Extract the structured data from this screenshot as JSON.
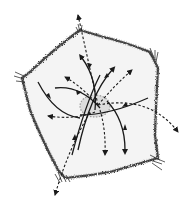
{
  "diagram": {
    "title": "",
    "colors": {
      "background": "#ffffff",
      "cell_fill": "#f4f4f4",
      "outline": "#3a3a3a",
      "arrow": "#1a1a1a",
      "nucleus": "#9a9a9a"
    },
    "outline_points": [
      [
        80,
        30
      ],
      [
        150,
        52
      ],
      [
        158,
        68
      ],
      [
        155,
        135
      ],
      [
        158,
        158
      ],
      [
        110,
        172
      ],
      [
        65,
        178
      ],
      [
        58,
        170
      ],
      [
        30,
        110
      ],
      [
        22,
        78
      ],
      [
        30,
        72
      ]
    ],
    "nucleus": {
      "cx": 95,
      "cy": 106,
      "rx": 15,
      "ry": 11
    },
    "arrows": {
      "solid": [
        {
          "d": "M82,58 Q98,80 95,110",
          "dir": "in"
        },
        {
          "d": "M112,70 Q90,95 78,150",
          "dir": "in",
          "head_at": "start"
        },
        {
          "d": "M38,82 Q55,115 80,118",
          "dir": "in"
        },
        {
          "d": "M55,88 Q80,85 100,108",
          "dir": "in"
        },
        {
          "d": "M148,98 Q110,115 80,115",
          "dir": "in"
        },
        {
          "d": "M107,101 Q125,120 125,150",
          "dir": "in",
          "head_at": "start"
        },
        {
          "d": "M100,75 Q85,105 72,155",
          "dir": "in",
          "head_at": "start"
        }
      ],
      "dashed": [
        {
          "d": "M98,105 L78,15",
          "dir": "out"
        },
        {
          "d": "M98,105 Q80,85 65,77",
          "dir": "out"
        },
        {
          "d": "M98,105 Q115,85 132,70",
          "dir": "out"
        },
        {
          "d": "M98,105 Q150,95 178,132",
          "dir": "out"
        },
        {
          "d": "M95,110 Q75,120 48,116",
          "dir": "out"
        },
        {
          "d": "M100,110 Q106,130 105,155",
          "dir": "out"
        },
        {
          "d": "M90,112 Q68,150 55,195",
          "dir": "out"
        }
      ]
    }
  }
}
